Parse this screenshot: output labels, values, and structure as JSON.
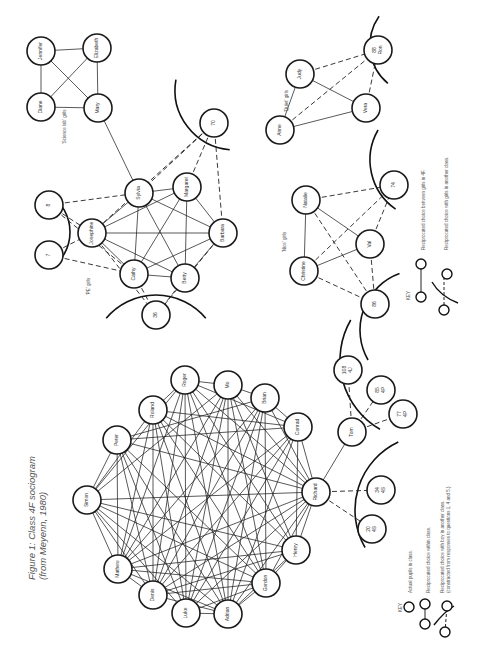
{
  "figure": {
    "title_line1": "Figure 1: Class 4F sociogram",
    "title_line2": "(from Meyenn, 1980)"
  },
  "groups": {
    "science_lab": "'Science lab' girls",
    "pe": "'PE' girls",
    "quiet": "'Quiet' girls",
    "nice": "'Nice' girls"
  },
  "key_girls": {
    "heading": "KEY",
    "item1": "Reciprocated choice between girls in 4F.",
    "item2": "Reciprocated choice with girls in another class."
  },
  "key_boys": {
    "heading": "KEY",
    "item1": "Actual pupils in class.",
    "item2": "Reciprocated choice within class.",
    "item3a": "Reciprocated choice with boy in another class.",
    "item3b": "(constructed from responses to questions 1, 4 and 5.)"
  },
  "nodes": [
    {
      "id": "jennifer",
      "label": "Jennifer",
      "x": 41,
      "y": 51,
      "r": 14
    },
    {
      "id": "elizabeth",
      "label": "Elizabeth",
      "x": 97,
      "y": 48,
      "r": 14
    },
    {
      "id": "diane",
      "label": "Diane",
      "x": 41,
      "y": 107,
      "r": 14
    },
    {
      "id": "mary",
      "label": "Mary",
      "x": 98,
      "y": 108,
      "r": 14
    },
    {
      "id": "n8",
      "label": "8",
      "x": 49,
      "y": 205,
      "r": 14
    },
    {
      "id": "n7",
      "label": "7",
      "x": 49,
      "y": 255,
      "r": 14
    },
    {
      "id": "josephine",
      "label": "Josephine",
      "x": 92,
      "y": 233,
      "r": 14
    },
    {
      "id": "sylvia",
      "label": "Sylvia",
      "x": 139,
      "y": 193,
      "r": 14
    },
    {
      "id": "margaret",
      "label": "Margaret",
      "x": 187,
      "y": 187,
      "r": 14
    },
    {
      "id": "barbara",
      "label": "Barbara",
      "x": 223,
      "y": 233,
      "r": 14
    },
    {
      "id": "cathy",
      "label": "Cathy",
      "x": 134,
      "y": 274,
      "r": 14
    },
    {
      "id": "betty",
      "label": "Betty",
      "x": 185,
      "y": 278,
      "r": 14
    },
    {
      "id": "n36",
      "label": "36",
      "x": 156,
      "y": 315,
      "r": 14
    },
    {
      "id": "n70",
      "label": "70",
      "x": 214,
      "y": 123,
      "r": 14
    },
    {
      "id": "judy",
      "label": "Judy",
      "x": 300,
      "y": 74,
      "r": 14
    },
    {
      "id": "n88",
      "label": "88 Ron",
      "x": 378,
      "y": 50,
      "r": 14
    },
    {
      "id": "anne",
      "label": "Anne",
      "x": 280,
      "y": 130,
      "r": 14
    },
    {
      "id": "vera",
      "label": "Vera",
      "x": 366,
      "y": 108,
      "r": 14
    },
    {
      "id": "natalie",
      "label": "Natalie",
      "x": 306,
      "y": 200,
      "r": 14
    },
    {
      "id": "n74",
      "label": "74",
      "x": 394,
      "y": 185,
      "r": 14
    },
    {
      "id": "val",
      "label": "Val",
      "x": 370,
      "y": 244,
      "r": 14
    },
    {
      "id": "christine",
      "label": "Christine",
      "x": 304,
      "y": 271,
      "r": 14
    },
    {
      "id": "n86",
      "label": "86",
      "x": 375,
      "y": 304,
      "r": 14
    },
    {
      "id": "roger",
      "label": "Roger",
      "x": 185,
      "y": 380,
      "r": 14
    },
    {
      "id": "mo",
      "label": "Mo",
      "x": 228,
      "y": 385,
      "r": 14
    },
    {
      "id": "roland",
      "label": "Roland",
      "x": 153,
      "y": 410,
      "r": 14
    },
    {
      "id": "peter",
      "label": "Peter",
      "x": 117,
      "y": 440,
      "r": 14
    },
    {
      "id": "brian",
      "label": "Brian",
      "x": 265,
      "y": 398,
      "r": 14
    },
    {
      "id": "conrad",
      "label": "Conrad",
      "x": 298,
      "y": 427,
      "r": 14
    },
    {
      "id": "simon",
      "label": "Simon",
      "x": 87,
      "y": 500,
      "r": 14
    },
    {
      "id": "tom",
      "label": "Tom",
      "x": 352,
      "y": 432,
      "r": 14
    },
    {
      "id": "richard",
      "label": "Richard",
      "x": 316,
      "y": 492,
      "r": 14
    },
    {
      "id": "mathew",
      "label": "Mathew",
      "x": 118,
      "y": 569,
      "r": 14
    },
    {
      "id": "denis",
      "label": "Denis",
      "x": 153,
      "y": 595,
      "r": 14
    },
    {
      "id": "henry",
      "label": "Henry",
      "x": 296,
      "y": 550,
      "r": 14
    },
    {
      "id": "luke",
      "label": "Luke",
      "x": 186,
      "y": 613,
      "r": 14
    },
    {
      "id": "gordon",
      "label": "Gordon",
      "x": 266,
      "y": 583,
      "r": 14
    },
    {
      "id": "adrian",
      "label": "Adrian",
      "x": 228,
      "y": 614,
      "r": 14
    },
    {
      "id": "n108",
      "label": "108 4J",
      "x": 348,
      "y": 370,
      "r": 14
    },
    {
      "id": "n85",
      "label": "85 4P",
      "x": 381,
      "y": 390,
      "r": 14
    },
    {
      "id": "n77",
      "label": "77 4P",
      "x": 403,
      "y": 414,
      "r": 14
    },
    {
      "id": "n34",
      "label": "34 4S",
      "x": 381,
      "y": 490,
      "r": 14
    },
    {
      "id": "n20",
      "label": "20 4S",
      "x": 372,
      "y": 529,
      "r": 14
    }
  ],
  "edges_solid": [
    [
      "jennifer",
      "elizabeth"
    ],
    [
      "jennifer",
      "diane"
    ],
    [
      "jennifer",
      "mary"
    ],
    [
      "elizabeth",
      "diane"
    ],
    [
      "elizabeth",
      "mary"
    ],
    [
      "diane",
      "mary"
    ],
    [
      "mary",
      "sylvia"
    ],
    [
      "sylvia",
      "margaret"
    ],
    [
      "sylvia",
      "josephine"
    ],
    [
      "sylvia",
      "barbara"
    ],
    [
      "sylvia",
      "betty"
    ],
    [
      "sylvia",
      "cathy"
    ],
    [
      "margaret",
      "josephine"
    ],
    [
      "margaret",
      "barbara"
    ],
    [
      "margaret",
      "cathy"
    ],
    [
      "margaret",
      "betty"
    ],
    [
      "josephine",
      "barbara"
    ],
    [
      "josephine",
      "cathy"
    ],
    [
      "josephine",
      "betty"
    ],
    [
      "barbara",
      "cathy"
    ],
    [
      "barbara",
      "betty"
    ],
    [
      "cathy",
      "betty"
    ],
    [
      "judy",
      "anne"
    ],
    [
      "judy",
      "vera"
    ],
    [
      "anne",
      "vera"
    ],
    [
      "natalie",
      "christine"
    ],
    [
      "natalie",
      "val"
    ],
    [
      "christine",
      "val"
    ],
    [
      "roger",
      "mo"
    ],
    [
      "roger",
      "roland"
    ],
    [
      "mo",
      "brian"
    ],
    [
      "brian",
      "conrad"
    ],
    [
      "conrad",
      "richard"
    ],
    [
      "tom",
      "richard"
    ],
    [
      "simon",
      "peter"
    ],
    [
      "simon",
      "roland"
    ],
    [
      "simon",
      "roger"
    ],
    [
      "simon",
      "mo"
    ],
    [
      "simon",
      "richard"
    ],
    [
      "simon",
      "mathew"
    ],
    [
      "simon",
      "denis"
    ],
    [
      "simon",
      "adrian"
    ],
    [
      "simon",
      "gordon"
    ],
    [
      "simon",
      "luke"
    ],
    [
      "simon",
      "henry"
    ],
    [
      "peter",
      "richard"
    ],
    [
      "peter",
      "conrad"
    ],
    [
      "peter",
      "adrian"
    ],
    [
      "peter",
      "gordon"
    ],
    [
      "peter",
      "luke"
    ],
    [
      "peter",
      "mathew"
    ],
    [
      "peter",
      "denis"
    ],
    [
      "peter",
      "brian"
    ],
    [
      "roland",
      "adrian"
    ],
    [
      "roland",
      "luke"
    ],
    [
      "roland",
      "denis"
    ],
    [
      "roland",
      "mathew"
    ],
    [
      "roland",
      "richard"
    ],
    [
      "roland",
      "henry"
    ],
    [
      "roland",
      "gordon"
    ],
    [
      "roland",
      "conrad"
    ],
    [
      "roger",
      "adrian"
    ],
    [
      "roger",
      "luke"
    ],
    [
      "roger",
      "denis"
    ],
    [
      "roger",
      "mathew"
    ],
    [
      "roger",
      "gordon"
    ],
    [
      "roger",
      "henry"
    ],
    [
      "roger",
      "richard"
    ],
    [
      "roger",
      "conrad"
    ],
    [
      "mo",
      "adrian"
    ],
    [
      "mo",
      "luke"
    ],
    [
      "mo",
      "denis"
    ],
    [
      "mo",
      "mathew"
    ],
    [
      "mo",
      "gordon"
    ],
    [
      "mo",
      "henry"
    ],
    [
      "mo",
      "richard"
    ],
    [
      "brian",
      "adrian"
    ],
    [
      "brian",
      "luke"
    ],
    [
      "brian",
      "denis"
    ],
    [
      "brian",
      "mathew"
    ],
    [
      "brian",
      "gordon"
    ],
    [
      "brian",
      "richard"
    ],
    [
      "conrad",
      "adrian"
    ],
    [
      "conrad",
      "mathew"
    ],
    [
      "conrad",
      "denis"
    ],
    [
      "conrad",
      "luke"
    ],
    [
      "conrad",
      "henry"
    ],
    [
      "richard",
      "mathew"
    ],
    [
      "richard",
      "denis"
    ],
    [
      "richard",
      "adrian"
    ],
    [
      "richard",
      "gordon"
    ],
    [
      "richard",
      "henry"
    ],
    [
      "richard",
      "luke"
    ],
    [
      "mathew",
      "denis"
    ],
    [
      "mathew",
      "adrian"
    ],
    [
      "mathew",
      "henry"
    ],
    [
      "mathew",
      "gordon"
    ],
    [
      "denis",
      "adrian"
    ],
    [
      "denis",
      "gordon"
    ],
    [
      "denis",
      "henry"
    ],
    [
      "luke",
      "adrian"
    ],
    [
      "luke",
      "gordon"
    ],
    [
      "adrian",
      "gordon"
    ],
    [
      "adrian",
      "henry"
    ],
    [
      "gordon",
      "henry"
    ]
  ],
  "edges_dashed": [
    [
      "n8",
      "sylvia"
    ],
    [
      "n8",
      "cathy"
    ],
    [
      "n7",
      "cathy"
    ],
    [
      "n7",
      "josephine"
    ],
    [
      "n8",
      "josephine"
    ],
    [
      "josephine",
      "n36"
    ],
    [
      "cathy",
      "n36"
    ],
    [
      "betty",
      "n36"
    ],
    [
      "barbara",
      "n36"
    ],
    [
      "n70",
      "sylvia"
    ],
    [
      "n70",
      "josephine"
    ],
    [
      "n70",
      "margaret"
    ],
    [
      "n70",
      "barbara"
    ],
    [
      "judy",
      "n88"
    ],
    [
      "anne",
      "n88"
    ],
    [
      "vera",
      "n88"
    ],
    [
      "natalie",
      "n74"
    ],
    [
      "christine",
      "n74"
    ],
    [
      "val",
      "n74"
    ],
    [
      "natalie",
      "n86"
    ],
    [
      "christine",
      "n86"
    ],
    [
      "val",
      "n86"
    ],
    [
      "tom",
      "n108"
    ],
    [
      "tom",
      "n85"
    ],
    [
      "tom",
      "n77"
    ],
    [
      "richard",
      "n34"
    ],
    [
      "richard",
      "n20"
    ]
  ],
  "arcs": [
    {
      "cx": 25,
      "cy": 232,
      "r": 45,
      "a0": -55,
      "a1": 55
    },
    {
      "cx": 156,
      "cy": 360,
      "r": 65,
      "a0": 220,
      "a1": 320
    },
    {
      "cx": 235,
      "cy": 90,
      "r": 60,
      "a0": 95,
      "a1": 190
    },
    {
      "cx": 420,
      "cy": 45,
      "r": 50,
      "a0": 130,
      "a1": 215
    },
    {
      "cx": 430,
      "cy": 160,
      "r": 60,
      "a0": 125,
      "a1": 210
    },
    {
      "cx": 420,
      "cy": 330,
      "r": 60,
      "a0": 150,
      "a1": 250
    },
    {
      "cx": 420,
      "cy": 360,
      "r": 80,
      "a0": 120,
      "a1": 210
    },
    {
      "cx": 430,
      "cy": 510,
      "r": 75,
      "a0": 150,
      "a1": 245
    }
  ]
}
